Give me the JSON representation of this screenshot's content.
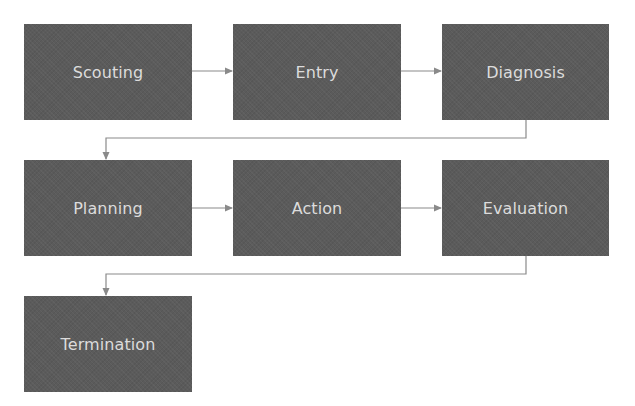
{
  "diagram": {
    "type": "process-flow",
    "colors": {
      "node_fill": "#5b5b5b",
      "node_text": "#dcdcdc",
      "connector": "#8a8a8a",
      "background": "#ffffff"
    },
    "nodes": [
      {
        "id": "scouting",
        "label": "Scouting",
        "row": 1,
        "col": 1
      },
      {
        "id": "entry",
        "label": "Entry",
        "row": 1,
        "col": 2
      },
      {
        "id": "diagnosis",
        "label": "Diagnosis",
        "row": 1,
        "col": 3
      },
      {
        "id": "planning",
        "label": "Planning",
        "row": 2,
        "col": 1
      },
      {
        "id": "action",
        "label": "Action",
        "row": 2,
        "col": 2
      },
      {
        "id": "evaluation",
        "label": "Evaluation",
        "row": 2,
        "col": 3
      },
      {
        "id": "termination",
        "label": "Termination",
        "row": 3,
        "col": 1
      }
    ],
    "edges": [
      {
        "from": "scouting",
        "to": "entry"
      },
      {
        "from": "entry",
        "to": "diagnosis"
      },
      {
        "from": "diagnosis",
        "to": "planning"
      },
      {
        "from": "planning",
        "to": "action"
      },
      {
        "from": "action",
        "to": "evaluation"
      },
      {
        "from": "evaluation",
        "to": "termination"
      }
    ]
  }
}
